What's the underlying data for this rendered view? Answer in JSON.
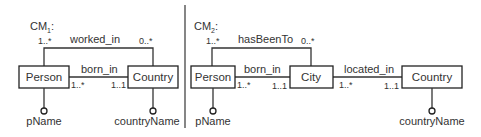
{
  "diagrams": [
    {
      "title": "CM",
      "subscript": "1",
      "title_suffix": ":",
      "entities": [
        {
          "name": "Person",
          "attribute": "pName"
        },
        {
          "name": "Country",
          "attribute": "countryName"
        }
      ],
      "relationships": [
        {
          "name": "worked_in",
          "from": "Person",
          "to": "Country",
          "from_card": "1..*",
          "to_card": "0..*"
        },
        {
          "name": "born_in",
          "from": "Person",
          "to": "Country",
          "from_card": "1..*",
          "to_card": "1..1"
        }
      ]
    },
    {
      "title": "CM",
      "subscript": "2",
      "title_suffix": ":",
      "entities": [
        {
          "name": "Person",
          "attribute": "pName"
        },
        {
          "name": "City"
        },
        {
          "name": "Country",
          "attribute": "countryName"
        }
      ],
      "relationships": [
        {
          "name": "hasBeenTo",
          "from": "Person",
          "to": "City",
          "from_card": "1..*",
          "to_card": "0..*"
        },
        {
          "name": "born_in",
          "from": "Person",
          "to": "City",
          "from_card": "1..*",
          "to_card": "1..1"
        },
        {
          "name": "located_in",
          "from": "City",
          "to": "Country",
          "from_card": "1..*",
          "to_card": "1..1"
        }
      ]
    }
  ]
}
